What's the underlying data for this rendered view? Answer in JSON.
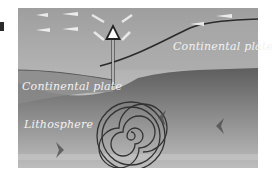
{
  "figure": {
    "labels": {
      "continental_plate_right": "Continental plate",
      "continental_plate_left": "Continental plate",
      "lithosphere": "Lithosphere"
    },
    "colors": {
      "sky_top": "#a8a8a8",
      "sky_bottom": "#cfcfcf",
      "upper_plate": "#9a9a9a",
      "left_plate": "#8c8c8c",
      "lithosphere_top": "#6e6e6e",
      "lithosphere_bottom": "#b6b6b6",
      "boundary_line": "#2b2b2b",
      "arrow_fill": "#ffffff",
      "spiral": "#3a3a3a"
    },
    "elements": [
      "horizontal-flow-arrows",
      "upward-arrow",
      "plate-boundary",
      "convection-spiral",
      "flow-chevrons"
    ]
  }
}
